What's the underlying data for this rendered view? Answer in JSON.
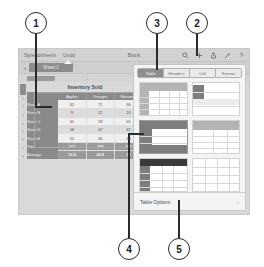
{
  "callouts": [
    {
      "num": "1"
    },
    {
      "num": "2"
    },
    {
      "num": "3"
    },
    {
      "num": "4"
    },
    {
      "num": "5"
    }
  ],
  "app": {
    "toolbar": {
      "back_label": "Spreadsheets",
      "undo_label": "Undo",
      "doc_title": "Blank",
      "icons": [
        {
          "name": "search-icon",
          "glyph": "search"
        },
        {
          "name": "insert-plus-icon",
          "glyph": "plus"
        },
        {
          "name": "share-icon",
          "glyph": "share"
        },
        {
          "name": "format-brush-icon",
          "glyph": "brush"
        },
        {
          "name": "help-icon",
          "glyph": "question"
        }
      ]
    },
    "sheet_bar": {
      "add_sheet_label": "+",
      "active_sheet": "Sheet 1"
    },
    "column_bar": {
      "ticks": [
        "+",
        "+",
        "+"
      ]
    },
    "row_gutter": {
      "numbers": [
        "1",
        "2",
        "3",
        "4",
        "5",
        "6",
        "7",
        "8",
        "9"
      ]
    }
  },
  "table": {
    "title": "Inventory Sold",
    "columns": [
      "Apples",
      "Oranges",
      "Bananas"
    ],
    "rows": [
      {
        "label": "Store A",
        "values": [
          "42",
          "71",
          "36"
        ]
      },
      {
        "label": "Store B",
        "values": [
          "9",
          "12",
          "24"
        ]
      },
      {
        "label": "Store C",
        "values": [
          "41",
          "28",
          "55"
        ]
      },
      {
        "label": "Store D",
        "values": [
          "18",
          "47",
          "31"
        ]
      },
      {
        "label": "Store E",
        "values": [
          "52",
          "46",
          "19"
        ]
      }
    ],
    "summary": [
      {
        "label": "Total",
        "values": [
          "162",
          "204",
          "165"
        ]
      },
      {
        "label": "Average",
        "values": [
          "32.4",
          "40.8",
          "33"
        ]
      }
    ]
  },
  "inspector": {
    "tabs": [
      {
        "label": "Table",
        "active": true
      },
      {
        "label": "Headers",
        "active": false
      },
      {
        "label": "Cell",
        "active": false
      },
      {
        "label": "Format",
        "active": false
      }
    ],
    "styles": [
      {
        "name": "style-plain-grid",
        "selected": false
      },
      {
        "name": "style-left-band",
        "selected": false
      },
      {
        "name": "style-dark-header-left",
        "selected": true
      },
      {
        "name": "style-gray-header-rows",
        "selected": false
      },
      {
        "name": "style-black-header",
        "selected": false
      },
      {
        "name": "style-light-grid",
        "selected": false
      }
    ],
    "options_label": "Table Options",
    "options_chevron": "›"
  },
  "colors": {
    "callout_stroke": "#2b2b2b",
    "device_bg": "#d9d9d9",
    "table_header": "#8a8a8a",
    "popover_bg": "#f4f4f4",
    "accent_selected": "#8e8e8e"
  }
}
